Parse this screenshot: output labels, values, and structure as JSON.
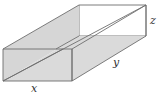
{
  "figure": {
    "type": "open-top rectangular box",
    "labels": {
      "x": "x",
      "y": "y",
      "z": "z"
    },
    "colors": {
      "face_fill": "#d9d9d9",
      "side_fill": "#d4d4d4",
      "inner_fill": "#dedede",
      "edge": "#6e6e6e",
      "label": "#333333",
      "background": "#ffffff"
    }
  }
}
